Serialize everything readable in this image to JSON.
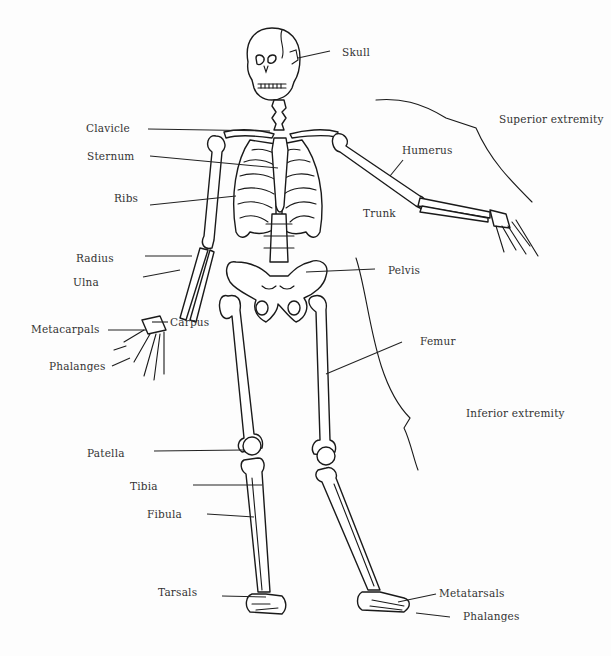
{
  "diagram": {
    "type": "anatomical skeleton, anterior view",
    "background": "#fdfdfd",
    "line_color": "#1a1a1a",
    "labels": {
      "skull": "Skull",
      "clavicle": "Clavicle",
      "sternum": "Sternum",
      "ribs": "Ribs",
      "humerus": "Humerus",
      "trunk": "Trunk",
      "superior_extremity": "Superior extremity",
      "radius": "Radius",
      "ulna": "Ulna",
      "carpus": "Carpus",
      "metacarpals": "Metacarpals",
      "phalanges_hand": "Phalanges",
      "pelvis": "Pelvis",
      "femur": "Femur",
      "inferior_extremity": "Inferior extremity",
      "patella": "Patella",
      "tibia": "Tibia",
      "fibula": "Fibula",
      "tarsals": "Tarsals",
      "metatarsals": "Metatarsals",
      "phalanges_foot": "Phalanges"
    }
  }
}
